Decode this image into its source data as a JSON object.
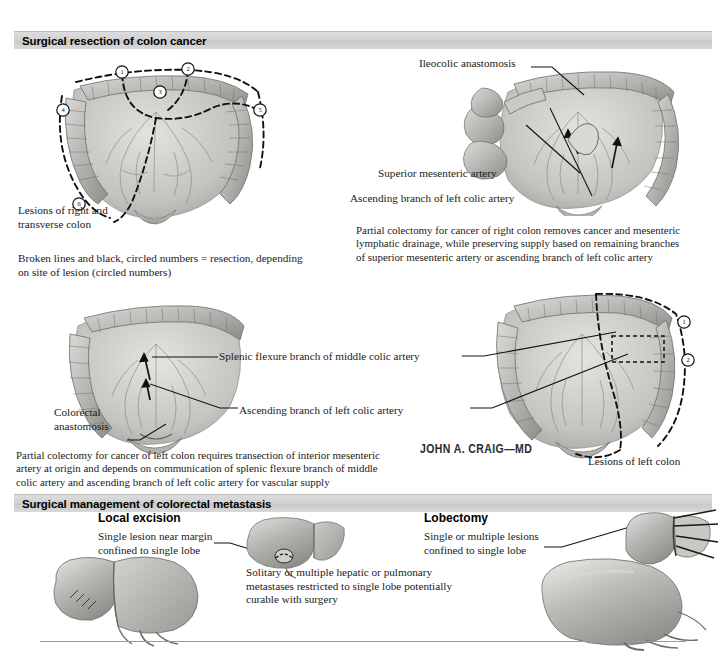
{
  "page": {
    "background": "#ffffff",
    "banner_color": "#d4d4d4",
    "ink_color": "#1a1a1a"
  },
  "sections": {
    "top": {
      "banner_title": "Surgical resection of colon cancer",
      "left_figure": {
        "label": "Lesions of right and\ntranssverse colon",
        "label_text": "Lesions of right and\ntransverse colon",
        "circled_numbers": [
          "1",
          "2",
          "3",
          "4",
          "5",
          "6"
        ],
        "caption": "Broken lines and black, circled numbers = resection, depending\non site of lesion (circled numbers)"
      },
      "right_figure": {
        "labels": [
          "Ileocolic anastomosis",
          "Superior mesenteric artery",
          "Ascending branch of left colic artery"
        ],
        "caption": "Partial colectomy for cancer of right colon removes cancer and mesenteric\nlymphatic drainage, while preserving supply based on remaining branches\nof superior mesenteric artery or ascending branch of left colic artery"
      }
    },
    "middle": {
      "labels": [
        "Splenic flexure branch of middle colic artery",
        "Ascending branch of left colic artery",
        "Colorectal\nanastomosis",
        "Lesions of left colon"
      ],
      "circled_numbers": [
        "1",
        "2"
      ],
      "caption": "Partial colectomy for cancer of left colon requires transection of interior mesenteric\nartery at origin and depends on communication of splenic flexure branch of middle\ncolic artery and ascending branch of left colic artery for vascular supply",
      "signature": "JOHN A. CRAIG—MD"
    },
    "bottom": {
      "banner_title": "Surgical management of colorectal metastasis",
      "left": {
        "heading": "Local excision",
        "label": "Single lesion near margin\nconfined to single lobe"
      },
      "right": {
        "heading": "Lobectomy",
        "label": "Single or multiple lesions\nconfined to single lobe"
      },
      "center_caption": "Solitary or multiple hepatic or pulmonary\nmetastases restricted to single lobe potentially\ncurable with surgery"
    }
  }
}
